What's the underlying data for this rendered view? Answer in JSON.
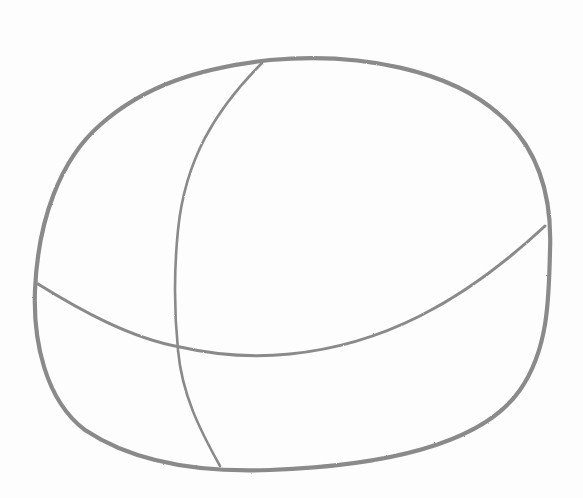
{
  "image": {
    "description": "Pencil sketch of a rounded, slightly squashed ball shape with two crossing guide curves (one vertical, one horizontal).",
    "colors": {
      "background": "#fdfdfd",
      "pencil": "#8a8a8a"
    },
    "shapes": [
      {
        "name": "outline",
        "type": "closed-curve"
      },
      {
        "name": "vertical-guide",
        "type": "open-curve"
      },
      {
        "name": "horizontal-guide",
        "type": "open-curve"
      }
    ]
  }
}
